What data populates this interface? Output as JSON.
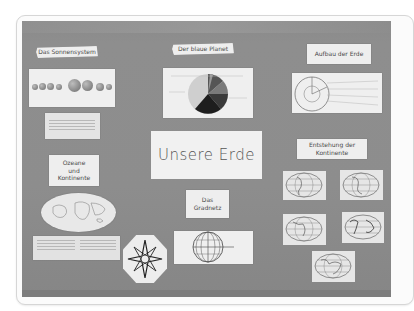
{
  "scene": {
    "description": "Photograph of a school bulletin board on grey felt, shown inside a rounded white frame",
    "background": "#ffffff",
    "board_color": "#8c8c8c",
    "paper_color": "#efefef"
  },
  "board": {
    "main_title": "Unsere Erde",
    "sections": [
      {
        "id": "sonnensystem",
        "heading": "Das Sonnensystem",
        "content": "planet row illustration",
        "note_card": "handwritten notes"
      },
      {
        "id": "blauer_planet",
        "heading": "Der blaue Planet",
        "content": "pie chart"
      },
      {
        "id": "aufbau",
        "heading": "Aufbau der Erde",
        "content": "cross-section diagram of Earth with labels"
      },
      {
        "id": "ozeane",
        "heading_lines": [
          "Ozeane",
          "und",
          "Kontinente"
        ],
        "content": "world map"
      },
      {
        "id": "gradnetz",
        "heading_lines": [
          "Das",
          "Gradnetz"
        ],
        "content": "globe grid diagram"
      },
      {
        "id": "entstehung",
        "heading_lines": [
          "Entstehung der",
          "Kontinente"
        ],
        "content": "five globe maps"
      }
    ],
    "compass": {
      "labels": [
        "N",
        "NO",
        "O",
        "SO",
        "S",
        "SW",
        "W",
        "NW"
      ]
    }
  }
}
